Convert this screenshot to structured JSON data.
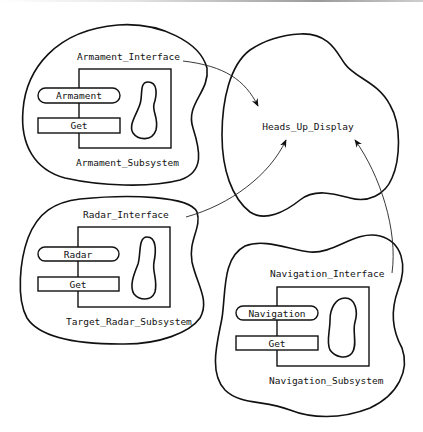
{
  "diagram": {
    "type": "subsystem-dependency-diagram",
    "hud": {
      "label": "Heads_Up_Display"
    },
    "subsystems": [
      {
        "id": "armament",
        "interface_label": "Armament_Interface",
        "subsystem_label": "Armament_Subsystem",
        "operations": [
          "Armament",
          "Get"
        ]
      },
      {
        "id": "radar",
        "interface_label": "Radar_Interface",
        "subsystem_label": "Target_Radar_Subsystem",
        "operations": [
          "Radar",
          "Get"
        ]
      },
      {
        "id": "navigation",
        "interface_label": "Navigation_Interface",
        "subsystem_label": "Navigation_Subsystem",
        "operations": [
          "Navigation",
          "Get"
        ]
      }
    ],
    "connections": [
      {
        "from": "Armament_Interface",
        "to": "Heads_Up_Display"
      },
      {
        "from": "Radar_Interface",
        "to": "Heads_Up_Display"
      },
      {
        "from": "Navigation_Interface",
        "to": "Heads_Up_Display"
      }
    ]
  }
}
